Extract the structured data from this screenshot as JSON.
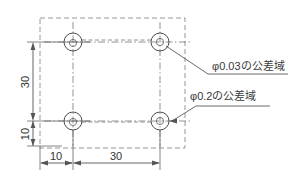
{
  "drawing": {
    "title": "穴位置度公差域図",
    "background_color": "#ffffff",
    "line_color": "#555555",
    "dashed_color": "#8a8a8a",
    "link_color": "#9a8a9a",
    "text_color": "#3a3a3a",
    "dimensions": {
      "vertical_upper": "30",
      "vertical_lower": "10",
      "horizontal_left": "10",
      "horizontal_right": "30"
    },
    "annotations": [
      {
        "id": "tolerance-zone-003",
        "label": "φ0.03の公差域",
        "value": "0.03",
        "symbol": "φ",
        "suffix": "の公差域"
      },
      {
        "id": "tolerance-zone-02",
        "label": "φ0.2の公差域",
        "value": "0.2",
        "symbol": "φ",
        "suffix": "の公差域"
      }
    ],
    "holes": [
      {
        "id": "hole-top-left",
        "cx": 73,
        "cy": 42,
        "r_zone": 9,
        "r_hole": 3.6
      },
      {
        "id": "hole-top-right",
        "cx": 160,
        "cy": 42,
        "r_zone": 9,
        "r_hole": 3.6
      },
      {
        "id": "hole-bottom-left",
        "cx": 73,
        "cy": 121,
        "r_zone": 9,
        "r_hole": 3.6
      },
      {
        "id": "hole-bottom-right",
        "cx": 160,
        "cy": 121,
        "r_zone": 9,
        "r_hole": 3.6
      }
    ],
    "boundary": {
      "x": 40,
      "y": 18,
      "width": 145,
      "height": 130
    }
  }
}
